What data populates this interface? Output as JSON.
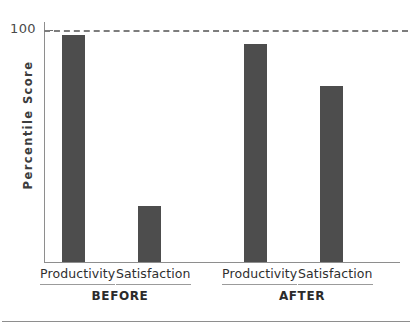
{
  "chart_data": {
    "type": "bar",
    "title": "",
    "subtitle": "",
    "xlabel": "",
    "ylabel": "Percentile Score",
    "ylim": [
      0,
      100
    ],
    "grid": false,
    "legend": "none",
    "categories": [
      "Productivity",
      "Satisfaction"
    ],
    "groups": [
      "BEFORE",
      "AFTER"
    ],
    "y_ticks": [
      "100"
    ],
    "reference_line": {
      "value": 100,
      "style": "dashed",
      "color": "#7d7d7d",
      "label": ""
    },
    "bar_color": "#4d4d4d",
    "series": [
      {
        "name": "BEFORE",
        "values": [
          98,
          24
        ]
      },
      {
        "name": "AFTER",
        "values": [
          94,
          76
        ]
      }
    ],
    "bars": [
      {
        "group": "BEFORE",
        "category": "Productivity",
        "value": 98
      },
      {
        "group": "BEFORE",
        "category": "Satisfaction",
        "value": 24
      },
      {
        "group": "AFTER",
        "category": "Productivity",
        "value": 94
      },
      {
        "group": "AFTER",
        "category": "Satisfaction",
        "value": 76
      }
    ]
  },
  "axis": {
    "y_title": "Percentile Score",
    "y_tick_100": "100"
  },
  "labels": {
    "before_productivity": "Productivity",
    "before_satisfaction": "Satisfaction",
    "after_productivity": "Productivity",
    "after_satisfaction": "Satisfaction",
    "group_before": "BEFORE",
    "group_after": "AFTER"
  }
}
